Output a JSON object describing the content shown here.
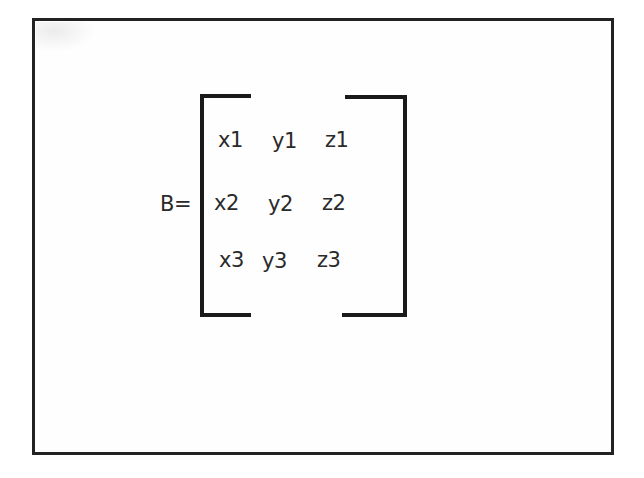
{
  "matrix": {
    "name": "B=",
    "rows": [
      [
        "x1",
        "y1",
        "z1"
      ],
      [
        "x2",
        "y2",
        "z2"
      ],
      [
        "x3",
        "y3",
        "z3"
      ]
    ]
  },
  "colors": {
    "frame": "#222222",
    "bracket": "#1a1a1a",
    "text": "#2a2a2a",
    "background": "#ffffff"
  }
}
